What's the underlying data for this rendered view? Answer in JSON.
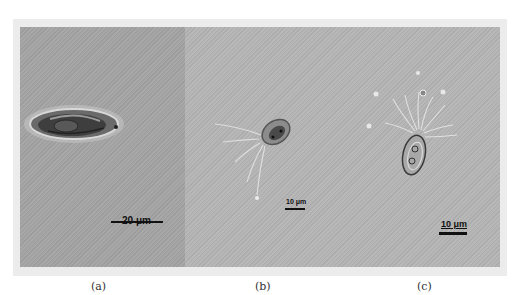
{
  "figure": {
    "panels": [
      {
        "id": "a",
        "caption": "(a)",
        "scale_bar": "20 μm",
        "description": "elongated oval ciliate cell, DIC micrograph"
      },
      {
        "id": "b",
        "caption": "(b)",
        "scale_bar": "10 μm",
        "description": "small oval cell with long trailing cirri"
      },
      {
        "id": "c",
        "caption": "(c)",
        "scale_bar": "10 μm",
        "description": "upright oval cell with fan of cilia"
      }
    ],
    "colors": {
      "panel_a_background": "#a4a4a4",
      "panel_bc_background": "#b5b5b5",
      "frame": "#ececec",
      "scale_bar": "#111111"
    }
  }
}
